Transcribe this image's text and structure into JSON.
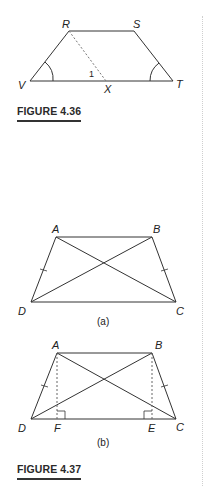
{
  "figures": [
    {
      "caption": "FIGURE 4.36",
      "shape": "trapezoid",
      "vertices": {
        "R": "R",
        "S": "S",
        "T": "T",
        "V": "V"
      },
      "points": {
        "X": "X"
      },
      "angle_label": "1",
      "segments": [
        "RS",
        "ST",
        "TV",
        "VR"
      ],
      "dashed_segments": [
        "RX"
      ],
      "marked_angles": [
        "V",
        "T"
      ]
    },
    {
      "caption": "FIGURE 4.37",
      "parts": [
        {
          "sublabel": "(a)",
          "vertices": {
            "A": "A",
            "B": "B",
            "C": "C",
            "D": "D"
          },
          "segments": [
            "AB",
            "BC",
            "CD",
            "DA"
          ],
          "diagonals": [
            "AC",
            "BD"
          ],
          "congruent_ticks": [
            "AD",
            "BC"
          ]
        },
        {
          "sublabel": "(b)",
          "vertices": {
            "A": "A",
            "B": "B",
            "C": "C",
            "D": "D"
          },
          "points": {
            "F": "F",
            "E": "E"
          },
          "segments": [
            "AB",
            "BC",
            "CD",
            "DA"
          ],
          "diagonals": [
            "AC",
            "BD"
          ],
          "dashed_segments": [
            "AF",
            "BE"
          ],
          "right_angles": [
            "F",
            "E"
          ],
          "congruent_ticks": [
            "AD",
            "BC"
          ]
        }
      ]
    }
  ]
}
